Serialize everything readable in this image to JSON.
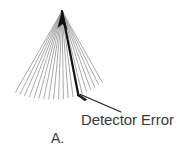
{
  "figure": {
    "panel_label": "A.",
    "annotation_label": "Detector Error",
    "colors": {
      "background": "#ffffff",
      "ray": "#9a9a9a",
      "highlight_ray": "#111111",
      "apex": "#141414",
      "text": "#3a3a3a",
      "leader": "#1a1a1a"
    }
  },
  "chart_data": {
    "type": "line",
    "title": "",
    "subtitle": "",
    "xlabel": "",
    "ylabel": "",
    "grid": false,
    "legend": "none",
    "apex": {
      "x": 62,
      "y": 11
    },
    "xlim": [
      0,
      193
    ],
    "ylim": [
      0,
      153
    ],
    "ray_count": 21,
    "highlight_index": 14,
    "series": [
      {
        "name": "Nominal rays",
        "endpoints": [
          {
            "x": 15.5,
            "y": 92.0
          },
          {
            "x": 20.0,
            "y": 94.0
          },
          {
            "x": 24.6,
            "y": 95.6
          },
          {
            "x": 29.3,
            "y": 96.9
          },
          {
            "x": 34.1,
            "y": 97.8
          },
          {
            "x": 38.9,
            "y": 98.4
          },
          {
            "x": 43.8,
            "y": 98.8
          },
          {
            "x": 48.7,
            "y": 99.0
          },
          {
            "x": 53.6,
            "y": 99.0
          },
          {
            "x": 58.5,
            "y": 98.8
          },
          {
            "x": 63.4,
            "y": 98.4
          },
          {
            "x": 68.2,
            "y": 97.7
          },
          {
            "x": 73.0,
            "y": 96.7
          },
          {
            "x": 77.6,
            "y": 95.4
          },
          {
            "x": 82.2,
            "y": 93.8
          },
          {
            "x": 86.6,
            "y": 91.9
          },
          {
            "x": 90.8,
            "y": 89.7
          },
          {
            "x": 94.8,
            "y": 87.3
          },
          {
            "x": 98.5,
            "y": 84.6
          },
          {
            "x": 102.0,
            "y": 81.7
          }
        ]
      },
      {
        "name": "Detector error ray",
        "endpoints": [
          {
            "x": 78.5,
            "y": 95.5
          }
        ]
      }
    ],
    "annotations": [
      {
        "text": "Detector Error",
        "target": {
          "x": 79,
          "y": 96
        },
        "label_anchor": {
          "x": 121,
          "y": 112
        }
      },
      {
        "text": "A.",
        "target": {
          "x": 58,
          "y": 140
        }
      }
    ]
  }
}
